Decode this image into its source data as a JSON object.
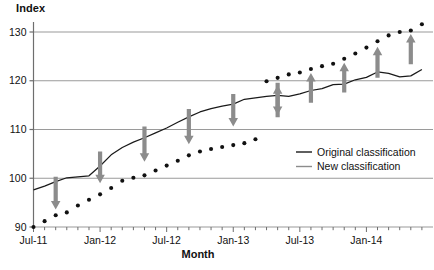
{
  "chart_data": {
    "type": "line",
    "title": "",
    "xlabel": "Month",
    "ylabel": "Index",
    "ylim": [
      90,
      133
    ],
    "xlim": [
      "Jul-11",
      "Jun-14"
    ],
    "grid": true,
    "yticks": [
      90,
      100,
      110,
      120,
      130
    ],
    "ytick_labels": [
      "90",
      "100",
      "110",
      "120",
      "130"
    ],
    "xtick_labels": [
      "Jul-11",
      "Jan-12",
      "Jul-12",
      "Jan-13",
      "Jul-13",
      "Jan-14"
    ],
    "xtick_indices": [
      0,
      6,
      12,
      18,
      24,
      30
    ],
    "minor_ticks": "monthly",
    "legend_position": "center-right",
    "x": [
      "Jul-11",
      "Aug-11",
      "Sep-11",
      "Oct-11",
      "Nov-11",
      "Dec-11",
      "Jan-12",
      "Feb-12",
      "Mar-12",
      "Apr-12",
      "May-12",
      "Jun-12",
      "Jul-12",
      "Aug-12",
      "Sep-12",
      "Oct-12",
      "Nov-12",
      "Dec-12",
      "Jan-13",
      "Feb-13",
      "Mar-13",
      "Apr-13",
      "May-13",
      "Jun-13",
      "Jul-13",
      "Aug-13",
      "Sep-13",
      "Oct-13",
      "Nov-13",
      "Dec-13",
      "Jan-14",
      "Feb-14",
      "Mar-14",
      "Apr-14",
      "May-14",
      "Jun-14"
    ],
    "series": [
      {
        "name": "Original classification",
        "style": "solid",
        "color": "#1a1a1a",
        "values": [
          97.6,
          98.4,
          99.3,
          100.1,
          100.3,
          100.5,
          102.5,
          104.8,
          106.3,
          107.4,
          108.3,
          109.3,
          110.3,
          111.5,
          112.6,
          113.6,
          114.3,
          114.8,
          115.2,
          116.2,
          116.5,
          116.8,
          117.0,
          116.8,
          117.3,
          118.0,
          118.4,
          119.2,
          119.3,
          120.2,
          120.7,
          121.8,
          121.5,
          120.8,
          121.0,
          122.3
        ]
      },
      {
        "name": "New classification",
        "style": "dotted",
        "color": "#111111",
        "values": [
          90.0,
          91.2,
          92.4,
          93.0,
          94.4,
          95.6,
          96.7,
          98.0,
          99.5,
          100.1,
          100.6,
          101.6,
          102.6,
          103.6,
          104.7,
          105.5,
          106.0,
          106.4,
          106.8,
          107.2,
          108.0,
          119.9,
          120.6,
          121.3,
          121.7,
          122.4,
          123.0,
          123.5,
          124.5,
          125.6,
          126.8,
          128.1,
          129.3,
          130.0,
          130.3,
          131.6
        ]
      }
    ],
    "annotations": {
      "arrow_color": "#8c8c8c",
      "down_arrows": [
        {
          "x_index": 2,
          "from": 100.3,
          "to": 93.6
        },
        {
          "x_index": 6,
          "from": 105.5,
          "to": 99.0
        },
        {
          "x_index": 10,
          "from": 110.6,
          "to": 103.4
        },
        {
          "x_index": 14,
          "from": 114.2,
          "to": 107.0
        },
        {
          "x_index": 18,
          "from": 117.3,
          "to": 110.6
        },
        {
          "x_index": 22,
          "from": 119.6,
          "to": 113.0
        }
      ],
      "up_arrows": [
        {
          "x_index": 22,
          "from": 112.5,
          "to": 119.1
        },
        {
          "x_index": 25,
          "from": 115.5,
          "to": 121.6
        },
        {
          "x_index": 28,
          "from": 117.6,
          "to": 123.7
        },
        {
          "x_index": 31,
          "from": 120.6,
          "to": 127.0
        },
        {
          "x_index": 34,
          "from": 123.4,
          "to": 129.6
        }
      ]
    }
  },
  "legend": {
    "items": [
      {
        "label": "Original classification",
        "style": "solid",
        "color": "#1a1a1a"
      },
      {
        "label": "New classification",
        "style": "solid",
        "color": "#8c8c8c"
      }
    ]
  },
  "axes": {
    "y_title": "Index",
    "x_title": "Month"
  }
}
